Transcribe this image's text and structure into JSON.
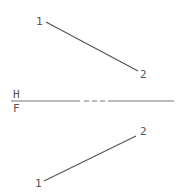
{
  "diagram": {
    "type": "descriptive-geometry-projection",
    "reference_line": {
      "upper_plane_label": "H",
      "lower_plane_label": "F",
      "style": "solid with dashed center section"
    },
    "top_view": {
      "point_labels": [
        "1",
        "2"
      ]
    },
    "front_view": {
      "point_labels": [
        "1",
        "2"
      ]
    },
    "line_color": "#555555"
  }
}
